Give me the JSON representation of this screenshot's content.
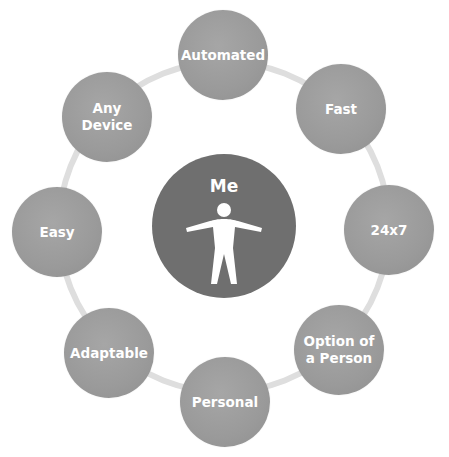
{
  "diagram": {
    "type": "hub-and-spoke ring",
    "center": {
      "label": "Me",
      "icon": "person-icon"
    },
    "nodes": [
      {
        "label": "Automated"
      },
      {
        "label": "Fast"
      },
      {
        "label": "24x7"
      },
      {
        "label": "Option of\na Person"
      },
      {
        "label": "Personal"
      },
      {
        "label": "Adaptable"
      },
      {
        "label": "Easy"
      },
      {
        "label": "Any\nDevice"
      }
    ],
    "colors": {
      "ring": "#dedede",
      "node": "#9c9c9c",
      "center": "#6f6f6f",
      "text": "#ffffff"
    }
  }
}
